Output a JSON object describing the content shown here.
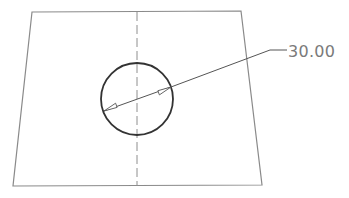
{
  "drawing": {
    "type": "technical-drawing",
    "plate": {
      "shape": "quadrilateral",
      "corners": [
        [
          32,
          12
        ],
        [
          241,
          11
        ],
        [
          262,
          185
        ],
        [
          13,
          186
        ]
      ],
      "stroke": "#8a8a8a"
    },
    "centerline": {
      "x": 137,
      "y1": 12,
      "y2": 186,
      "style": "dashed",
      "stroke": "#8e8e8e"
    },
    "hole": {
      "shape": "circle",
      "cx": 137,
      "cy": 99,
      "r": 36,
      "stroke": "#333333"
    },
    "dimension": {
      "kind": "diameter",
      "value": "30.00",
      "arrow_style": "open-triangle",
      "arrow_start": [
        104,
        111
      ],
      "arrow_end": [
        171,
        87
      ],
      "leader_elbow": [
        270,
        50
      ],
      "leader_end": [
        287,
        50
      ],
      "text_position": [
        288,
        57
      ],
      "text_color": "#7a7a7a"
    }
  }
}
